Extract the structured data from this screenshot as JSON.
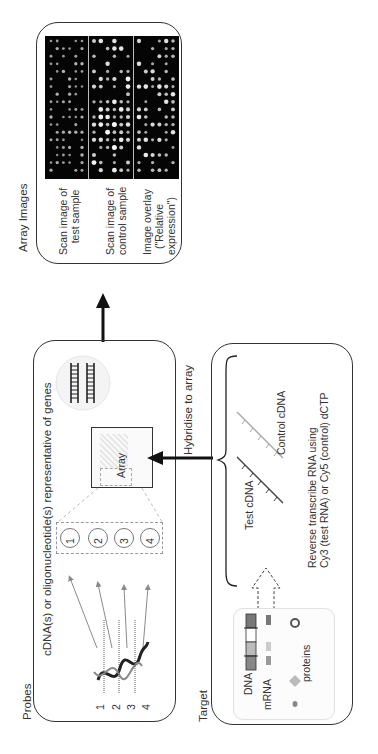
{
  "figure": {
    "orientation": "rotated -90deg",
    "array_images": {
      "title": "Array Images",
      "panels": [
        {
          "line1": "Scan image of",
          "line2": "test sample"
        },
        {
          "line1": "Scan image of",
          "line2": "control sample"
        },
        {
          "line1": "Image overlay",
          "line2": "(\"Relative",
          "line3": "expression\")"
        }
      ]
    },
    "probes": {
      "title": "Probes",
      "caption": "cDNA(s) or oligonucleotide(s) representative of genes",
      "array_label": "Array",
      "spots": [
        "1",
        "2",
        "3",
        "4"
      ],
      "helix_markers": [
        "1",
        "2",
        "3",
        "4"
      ]
    },
    "hybridise": {
      "label": "Hybridise to array"
    },
    "target": {
      "title": "Target",
      "test_cdna": "Test cDNA",
      "control_cdna": "Control cDNA",
      "rt_line1": "Reverse transcribe RNA using",
      "rt_line2": "Cy3 (test RNA) or Cy5 (control) dCTP",
      "dna_label": "DNA",
      "mrna_label": "mRNA",
      "proteins_label": "proteins"
    },
    "colors": {
      "line": "#333333",
      "arrow": "#111111",
      "dashed_gray": "#999999",
      "probe_arrow": "#8a8a8a",
      "scan_bg": "#050505",
      "spot": "#f2f2f2"
    }
  }
}
